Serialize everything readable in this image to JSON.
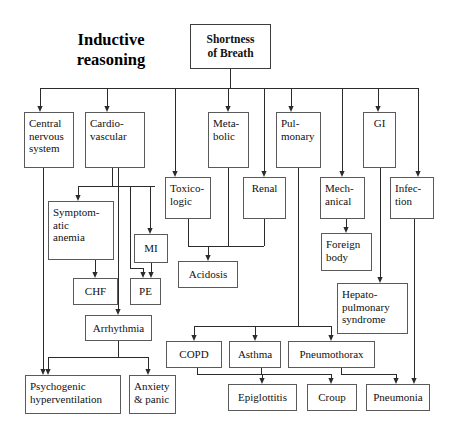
{
  "diagram": {
    "title": "Inductive reasoning",
    "title_lines": [
      "Inductive",
      "reasoning"
    ],
    "root": {
      "id": "shortness-of-breath",
      "label": "Shortness of Breath",
      "lines": [
        "Shortness",
        "of Breath"
      ]
    },
    "nodes": [
      {
        "id": "shortness-of-breath",
        "label": "Shortness of Breath",
        "lines": [
          "Shortness",
          "of Breath"
        ],
        "x": 190,
        "y": 24,
        "w": 81,
        "h": 45,
        "level": 0,
        "bold": true
      },
      {
        "id": "central-nervous-system",
        "label": "Central nervous system",
        "lines": [
          "Central",
          "nervous",
          "system"
        ],
        "x": 24,
        "y": 112,
        "w": 50,
        "h": 56,
        "level": 1
      },
      {
        "id": "cardiovascular",
        "label": "Cardio-vascular",
        "lines": [
          "Cardio-",
          "vascular"
        ],
        "x": 85,
        "y": 112,
        "w": 60,
        "h": 56,
        "level": 1
      },
      {
        "id": "metabolic",
        "label": "Meta-bolic",
        "lines": [
          "Meta-",
          "bolic"
        ],
        "x": 208,
        "y": 112,
        "w": 41,
        "h": 56,
        "level": 1
      },
      {
        "id": "pulmonary",
        "label": "Pul-monary",
        "lines": [
          "Pul-",
          "monary"
        ],
        "x": 276,
        "y": 112,
        "w": 45,
        "h": 56,
        "level": 1
      },
      {
        "id": "gi",
        "label": "GI",
        "lines": [
          "GI"
        ],
        "x": 363,
        "y": 112,
        "w": 33,
        "h": 56,
        "level": 1
      },
      {
        "id": "toxicologic",
        "label": "Toxico-logic",
        "lines": [
          "Toxico-",
          "logic"
        ],
        "x": 165,
        "y": 177,
        "w": 46,
        "h": 42,
        "level": 2
      },
      {
        "id": "renal",
        "label": "Renal",
        "lines": [
          "Renal"
        ],
        "x": 243,
        "y": 177,
        "w": 43,
        "h": 42,
        "level": 2
      },
      {
        "id": "mechanical",
        "label": "Mech-anical",
        "lines": [
          "Mech-",
          "anical"
        ],
        "x": 320,
        "y": 177,
        "w": 45,
        "h": 42,
        "level": 2
      },
      {
        "id": "infection",
        "label": "Infec-tion",
        "lines": [
          "Infec-",
          "tion"
        ],
        "x": 390,
        "y": 177,
        "w": 44,
        "h": 42,
        "level": 2
      },
      {
        "id": "symptomatic-anemia",
        "label": "Symptomatic anemia",
        "lines": [
          "Symptom-",
          "atic",
          "anemia"
        ],
        "x": 48,
        "y": 201,
        "w": 66,
        "h": 59,
        "level": 3
      },
      {
        "id": "mi",
        "label": "MI",
        "lines": [
          "MI"
        ],
        "x": 134,
        "y": 234,
        "w": 34,
        "h": 29,
        "level": 3
      },
      {
        "id": "foreign-body",
        "label": "Foreign body",
        "lines": [
          "Foreign",
          "body"
        ],
        "x": 321,
        "y": 233,
        "w": 51,
        "h": 38,
        "level": 3
      },
      {
        "id": "acidosis",
        "label": "Acidosis",
        "lines": [
          "Acidosis"
        ],
        "x": 178,
        "y": 261,
        "w": 60,
        "h": 27,
        "level": 4
      },
      {
        "id": "chf",
        "label": "CHF",
        "lines": [
          "CHF"
        ],
        "x": 73,
        "y": 278,
        "w": 45,
        "h": 27,
        "level": 4
      },
      {
        "id": "pe",
        "label": "PE",
        "lines": [
          "PE"
        ],
        "x": 130,
        "y": 278,
        "w": 31,
        "h": 27,
        "level": 4
      },
      {
        "id": "hepatopulmonary-syndrome",
        "label": "Hepato-pulmonary syndrome",
        "lines": [
          "Hepato-",
          "pulmonary",
          "syndrome"
        ],
        "x": 337,
        "y": 283,
        "w": 71,
        "h": 51,
        "level": 4
      },
      {
        "id": "arrhythmia",
        "label": "Arrhythmia",
        "lines": [
          "Arrhythmia"
        ],
        "x": 85,
        "y": 315,
        "w": 67,
        "h": 26,
        "level": 5
      },
      {
        "id": "copd",
        "label": "COPD",
        "lines": [
          "COPD"
        ],
        "x": 166,
        "y": 341,
        "w": 56,
        "h": 27,
        "level": 5
      },
      {
        "id": "asthma",
        "label": "Asthma",
        "lines": [
          "Asthma"
        ],
        "x": 229,
        "y": 341,
        "w": 52,
        "h": 27,
        "level": 5
      },
      {
        "id": "pneumothorax",
        "label": "Pneumothorax",
        "lines": [
          "Pneumothorax"
        ],
        "x": 288,
        "y": 341,
        "w": 87,
        "h": 27,
        "level": 5
      },
      {
        "id": "psychogenic-hyperventilation",
        "label": "Psychogenic hyperventilation",
        "lines": [
          "Psychogenic",
          "hyperventilation"
        ],
        "x": 25,
        "y": 375,
        "w": 96,
        "h": 39,
        "level": 6
      },
      {
        "id": "anxiety-panic",
        "label": "Anxiety & panic",
        "lines": [
          "Anxiety",
          "& panic"
        ],
        "x": 129,
        "y": 375,
        "w": 47,
        "h": 39,
        "level": 6
      },
      {
        "id": "epiglottitis",
        "label": "Epiglottitis",
        "lines": [
          "Epiglottitis"
        ],
        "x": 228,
        "y": 384,
        "w": 69,
        "h": 27,
        "level": 6
      },
      {
        "id": "croup",
        "label": "Croup",
        "lines": [
          "Croup"
        ],
        "x": 307,
        "y": 384,
        "w": 50,
        "h": 27,
        "level": 6
      },
      {
        "id": "pneumonia",
        "label": "Pneumonia",
        "lines": [
          "Pneumonia"
        ],
        "x": 366,
        "y": 384,
        "w": 64,
        "h": 27,
        "level": 6
      }
    ],
    "edges": [
      {
        "from": "shortness-of-breath",
        "to": "central-nervous-system"
      },
      {
        "from": "shortness-of-breath",
        "to": "cardiovascular"
      },
      {
        "from": "shortness-of-breath",
        "to": "metabolic"
      },
      {
        "from": "shortness-of-breath",
        "to": "pulmonary"
      },
      {
        "from": "shortness-of-breath",
        "to": "gi"
      },
      {
        "from": "shortness-of-breath",
        "to": "toxicologic"
      },
      {
        "from": "shortness-of-breath",
        "to": "renal"
      },
      {
        "from": "shortness-of-breath",
        "to": "mechanical"
      },
      {
        "from": "shortness-of-breath",
        "to": "infection"
      },
      {
        "from": "central-nervous-system",
        "to": "psychogenic-hyperventilation"
      },
      {
        "from": "cardiovascular",
        "to": "symptomatic-anemia"
      },
      {
        "from": "cardiovascular",
        "to": "mi"
      },
      {
        "from": "cardiovascular",
        "to": "arrhythmia"
      },
      {
        "from": "cardiovascular",
        "to": "pe"
      },
      {
        "from": "symptomatic-anemia",
        "to": "chf"
      },
      {
        "from": "mi",
        "to": "pe"
      },
      {
        "from": "toxicologic",
        "to": "acidosis"
      },
      {
        "from": "metabolic",
        "to": "acidosis"
      },
      {
        "from": "renal",
        "to": "acidosis"
      },
      {
        "from": "pulmonary",
        "to": "copd"
      },
      {
        "from": "pulmonary",
        "to": "asthma"
      },
      {
        "from": "pulmonary",
        "to": "pneumothorax"
      },
      {
        "from": "mechanical",
        "to": "foreign-body"
      },
      {
        "from": "gi",
        "to": "hepatopulmonary-syndrome"
      },
      {
        "from": "infection",
        "to": "pneumonia"
      },
      {
        "from": "arrhythmia",
        "to": "psychogenic-hyperventilation"
      },
      {
        "from": "arrhythmia",
        "to": "anxiety-panic"
      },
      {
        "from": "copd",
        "to": "epiglottitis"
      },
      {
        "from": "asthma",
        "to": "croup"
      },
      {
        "from": "pneumothorax",
        "to": "pneumonia"
      }
    ]
  },
  "style": {
    "box_border_color": "#5a5a5a",
    "line_color": "#2b2b2b",
    "background": "#ffffff",
    "text_color": "#111111"
  }
}
